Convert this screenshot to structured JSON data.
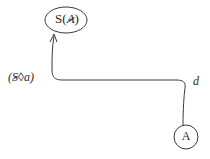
{
  "diagram": {
    "type": "state-transition",
    "nodes": [
      {
        "id": "top",
        "label": "S(A)",
        "shape": "ellipse",
        "cx": 66,
        "cy": 20,
        "rx": 21,
        "ry": 13
      },
      {
        "id": "bottom",
        "label": "A",
        "shape": "circle",
        "cx": 186,
        "cy": 137,
        "r": 12
      }
    ],
    "edges": [
      {
        "from": "bottom",
        "to": "top",
        "arrow": "to-top",
        "labels": {
          "left": "(S◊a)",
          "right": "d"
        }
      }
    ],
    "labels": {
      "top_node_prefix": "S(",
      "top_node_arg": "A",
      "top_node_suffix": ")",
      "bottom_node": "A",
      "edge_left_open": "(",
      "edge_left_symbol": "S",
      "edge_left_rest": "◊a)",
      "edge_right": "d"
    },
    "colors": {
      "stroke": "#3a3a3a",
      "text": "#2a2a2a",
      "background": "#ffffff"
    }
  }
}
